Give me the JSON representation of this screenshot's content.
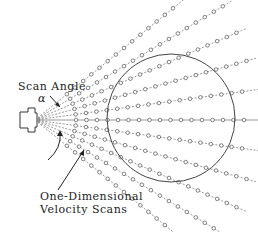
{
  "labels": {
    "scan_angle": "Scan Angle",
    "alpha": "α",
    "velocity_line1": "One-Dimensional",
    "velocity_line2": "Velocity Scans"
  },
  "diagram": {
    "origin": [
      35,
      120
    ],
    "ray_count": 11,
    "ray_angle_span_deg": 78,
    "ray_length": 230,
    "sample_spacing": 10.5,
    "sample_start": 20,
    "circle": {
      "cx": 171,
      "cy": 118,
      "r": 64
    },
    "colors": {
      "line": "#555555",
      "marker": "#666666",
      "circle": "#444444"
    }
  }
}
